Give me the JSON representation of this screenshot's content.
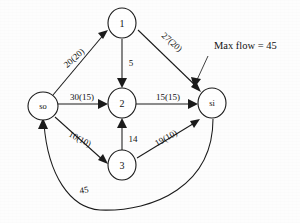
{
  "diagram": {
    "type": "flow-network",
    "title_annotation": "Max flow = 45",
    "nodes": [
      {
        "id": "so",
        "label": "so",
        "kind": "source",
        "cx": 43,
        "cy": 106,
        "rx": 15,
        "ry": 14
      },
      {
        "id": "n1",
        "label": "1",
        "kind": "intermediate",
        "cx": 122,
        "cy": 23,
        "rx": 14,
        "ry": 15
      },
      {
        "id": "n2",
        "label": "2",
        "kind": "intermediate",
        "cx": 122,
        "cy": 103,
        "rx": 14,
        "ry": 15
      },
      {
        "id": "n3",
        "label": "3",
        "kind": "intermediate",
        "cx": 122,
        "cy": 165,
        "rx": 14,
        "ry": 15
      },
      {
        "id": "si",
        "label": "si",
        "kind": "sink",
        "cx": 212,
        "cy": 103,
        "rx": 14,
        "ry": 15
      }
    ],
    "edges": [
      {
        "id": "so-1",
        "from": "so",
        "to": "n1",
        "label": "20(20)",
        "capacity": 20,
        "flow": 20,
        "label_x": 74,
        "label_y": 58,
        "label_rotation": -41
      },
      {
        "id": "1-si",
        "from": "n1",
        "to": "si",
        "label": "27(20)",
        "capacity": 27,
        "flow": 20,
        "label_x": 172,
        "label_y": 42,
        "label_rotation": 42
      },
      {
        "id": "1-2",
        "from": "n1",
        "to": "n2",
        "label": "5",
        "capacity": 5,
        "flow": null,
        "label_x": 131,
        "label_y": 63,
        "label_rotation": 0
      },
      {
        "id": "so-2",
        "from": "so",
        "to": "n2",
        "label": "30(15)",
        "capacity": 30,
        "flow": 15,
        "label_x": 82,
        "label_y": 97,
        "label_rotation": 0
      },
      {
        "id": "2-si",
        "from": "n2",
        "to": "si",
        "label": "15(15)",
        "capacity": 15,
        "flow": 15,
        "label_x": 168,
        "label_y": 97,
        "label_rotation": 0
      },
      {
        "id": "so-3",
        "from": "so",
        "to": "n3",
        "label": "10(10)",
        "capacity": 10,
        "flow": 10,
        "label_x": 80,
        "label_y": 139,
        "label_rotation": 28
      },
      {
        "id": "3-2",
        "from": "n3",
        "to": "n2",
        "label": "14",
        "capacity": 14,
        "flow": null,
        "label_x": 133,
        "label_y": 139,
        "label_rotation": 0
      },
      {
        "id": "3-si",
        "from": "n3",
        "to": "si",
        "label": "19(10)",
        "capacity": 19,
        "flow": 10,
        "label_x": 166,
        "label_y": 138,
        "label_rotation": -30
      },
      {
        "id": "si-so",
        "from": "si",
        "to": "so",
        "label": "45",
        "capacity": 45,
        "flow": null,
        "label_x": 84,
        "label_y": 190,
        "label_rotation": -9
      }
    ],
    "annotation": {
      "text": "Max flow = 45",
      "x": 214,
      "y": 45,
      "leader_from_x": 206,
      "leader_from_y": 57,
      "leader_to_x": 193,
      "leader_to_y": 85
    }
  }
}
